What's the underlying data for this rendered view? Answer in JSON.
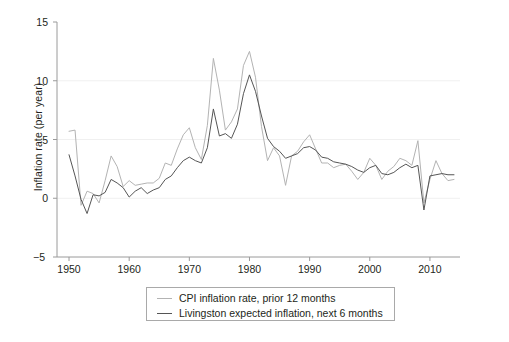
{
  "chart_data": {
    "type": "line",
    "title": "",
    "xlabel": "",
    "ylabel": "Inflation rate (per year)",
    "xlim": [
      1948,
      2015
    ],
    "ylim": [
      -5,
      15
    ],
    "xticks": [
      1950,
      1960,
      1970,
      1980,
      1990,
      2000,
      2010
    ],
    "yticks": [
      -5,
      0,
      5,
      10,
      15
    ],
    "gridlines": {
      "horizontal": [
        0,
        5,
        10
      ],
      "vertical": []
    },
    "legend_position": "below-center",
    "series": [
      {
        "name": "CPI inflation rate, prior 12 months",
        "color": "#b3b3b3",
        "x": [
          1950,
          1951,
          1952,
          1953,
          1954,
          1955,
          1956,
          1957,
          1958,
          1959,
          1960,
          1961,
          1962,
          1963,
          1964,
          1965,
          1966,
          1967,
          1968,
          1969,
          1970,
          1971,
          1972,
          1973,
          1974,
          1975,
          1976,
          1977,
          1978,
          1979,
          1980,
          1981,
          1982,
          1983,
          1984,
          1985,
          1986,
          1987,
          1988,
          1989,
          1990,
          1991,
          1992,
          1993,
          1994,
          1995,
          1996,
          1997,
          1998,
          1999,
          2000,
          2001,
          2002,
          2003,
          2004,
          2005,
          2006,
          2007,
          2008,
          2009,
          2010,
          2011,
          2012,
          2013,
          2014
        ],
        "values": [
          5.7,
          5.8,
          -0.6,
          0.6,
          0.4,
          -0.4,
          1.5,
          3.6,
          2.7,
          1.0,
          1.5,
          1.1,
          1.2,
          1.3,
          1.3,
          1.7,
          3.0,
          2.8,
          4.2,
          5.4,
          6.0,
          4.3,
          3.3,
          6.2,
          11.9,
          9.2,
          5.8,
          6.5,
          7.6,
          11.3,
          12.5,
          10.3,
          6.1,
          3.2,
          4.3,
          3.6,
          1.1,
          3.6,
          4.0,
          4.8,
          5.4,
          4.2,
          3.0,
          3.0,
          2.6,
          2.8,
          2.9,
          2.3,
          1.6,
          2.2,
          3.4,
          2.8,
          1.6,
          2.3,
          2.7,
          3.4,
          3.2,
          2.8,
          4.9,
          -0.4,
          1.6,
          3.2,
          2.1,
          1.5,
          1.6
        ]
      },
      {
        "name": "Livingston expected inflation, next 6 months",
        "color": "#555555",
        "x": [
          1950,
          1951,
          1952,
          1953,
          1954,
          1955,
          1956,
          1957,
          1958,
          1959,
          1960,
          1961,
          1962,
          1963,
          1964,
          1965,
          1966,
          1967,
          1968,
          1969,
          1970,
          1971,
          1972,
          1973,
          1974,
          1975,
          1976,
          1977,
          1978,
          1979,
          1980,
          1981,
          1982,
          1983,
          1984,
          1985,
          1986,
          1987,
          1988,
          1989,
          1990,
          1991,
          1992,
          1993,
          1994,
          1995,
          1996,
          1997,
          1998,
          1999,
          2000,
          2001,
          2002,
          2003,
          2004,
          2005,
          2006,
          2007,
          2008,
          2009,
          2010,
          2011,
          2012,
          2013,
          2014
        ],
        "values": [
          3.7,
          1.9,
          -0.1,
          -1.3,
          0.3,
          0.2,
          0.5,
          1.6,
          1.3,
          0.9,
          0.1,
          0.6,
          0.9,
          0.4,
          0.7,
          0.9,
          1.6,
          1.9,
          2.6,
          3.2,
          3.5,
          3.2,
          3.0,
          4.3,
          7.6,
          5.3,
          5.5,
          5.1,
          6.3,
          8.9,
          10.5,
          9.1,
          7.0,
          5.1,
          4.4,
          4.0,
          3.4,
          3.6,
          3.8,
          4.3,
          4.4,
          4.1,
          3.5,
          3.4,
          3.1,
          3.0,
          2.9,
          2.7,
          2.4,
          2.2,
          2.6,
          2.8,
          2.1,
          2.0,
          2.2,
          2.6,
          2.9,
          2.6,
          2.8,
          -1.0,
          1.9,
          2.0,
          2.1,
          2.0,
          2.0
        ]
      }
    ]
  },
  "axes": {
    "y_label": "Inflation rate (per year)",
    "y_ticks": [
      "15",
      "10",
      "5",
      "0",
      "−5"
    ],
    "x_ticks": [
      "1950",
      "1960",
      "1970",
      "1980",
      "1990",
      "2000",
      "2010"
    ]
  },
  "legend": {
    "entries": [
      {
        "label": "CPI inflation rate, prior 12 months",
        "color": "#b3b3b3"
      },
      {
        "label": "Livingston expected inflation, next 6 months",
        "color": "#555555"
      }
    ]
  }
}
